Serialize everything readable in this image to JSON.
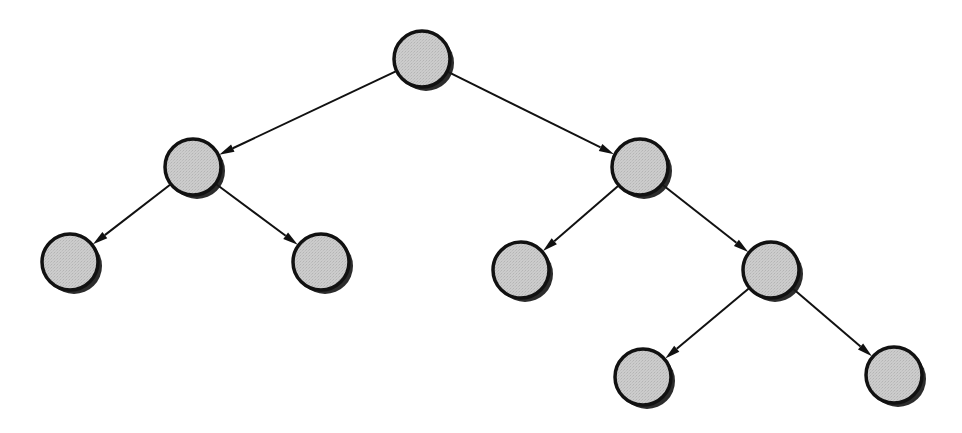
{
  "diagram": {
    "type": "binary-tree",
    "canvas": {
      "width": 962,
      "height": 433
    },
    "background_color": "#ffffff",
    "style": {
      "node_fill": "#c9c9c9",
      "node_stroke": "#111111",
      "node_stroke_width": 3.5,
      "node_radius": 28,
      "node_shadow_color": "#1a1a1a",
      "node_shadow_offset_x": 4,
      "node_shadow_offset_y": 4,
      "edge_color": "#111111",
      "edge_width": 2,
      "arrowhead": "filled-triangle",
      "arrowhead_length": 15,
      "arrowhead_width": 8
    },
    "nodes": [
      {
        "id": "root",
        "label": "",
        "cx": 422,
        "cy": 59,
        "r": 28,
        "role": "root",
        "depth": 0
      },
      {
        "id": "n-l",
        "label": "",
        "cx": 193,
        "cy": 167,
        "r": 28,
        "role": "internal",
        "depth": 1
      },
      {
        "id": "n-r",
        "label": "",
        "cx": 640,
        "cy": 167,
        "r": 28,
        "role": "internal",
        "depth": 1
      },
      {
        "id": "n-ll",
        "label": "",
        "cx": 70,
        "cy": 262,
        "r": 28,
        "role": "leaf",
        "depth": 2
      },
      {
        "id": "n-lr",
        "label": "",
        "cx": 321,
        "cy": 262,
        "r": 28,
        "role": "leaf",
        "depth": 2
      },
      {
        "id": "n-rl",
        "label": "",
        "cx": 521,
        "cy": 270,
        "r": 28,
        "role": "leaf",
        "depth": 2
      },
      {
        "id": "n-rr",
        "label": "",
        "cx": 771,
        "cy": 270,
        "r": 28,
        "role": "internal",
        "depth": 2
      },
      {
        "id": "n-rrl",
        "label": "",
        "cx": 643,
        "cy": 377,
        "r": 28,
        "role": "leaf",
        "depth": 3
      },
      {
        "id": "n-rrr",
        "label": "",
        "cx": 894,
        "cy": 375,
        "r": 28,
        "role": "leaf",
        "depth": 3
      }
    ],
    "edges": [
      {
        "id": "e-root-l",
        "from": "root",
        "to": "n-l",
        "direction": "left",
        "directed": true
      },
      {
        "id": "e-root-r",
        "from": "root",
        "to": "n-r",
        "direction": "right",
        "directed": true
      },
      {
        "id": "e-l-ll",
        "from": "n-l",
        "to": "n-ll",
        "direction": "left",
        "directed": true
      },
      {
        "id": "e-l-lr",
        "from": "n-l",
        "to": "n-lr",
        "direction": "right",
        "directed": true
      },
      {
        "id": "e-r-rl",
        "from": "n-r",
        "to": "n-rl",
        "direction": "left",
        "directed": true
      },
      {
        "id": "e-r-rr",
        "from": "n-r",
        "to": "n-rr",
        "direction": "right",
        "directed": true
      },
      {
        "id": "e-rr-rrl",
        "from": "n-rr",
        "to": "n-rrl",
        "direction": "left",
        "directed": true
      },
      {
        "id": "e-rr-rrr",
        "from": "n-rr",
        "to": "n-rrr",
        "direction": "right",
        "directed": true
      }
    ]
  }
}
